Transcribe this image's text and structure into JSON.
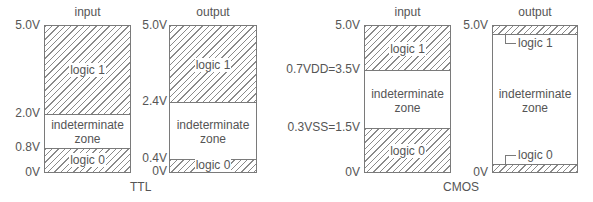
{
  "ttl": {
    "group_label": "TTL",
    "input": {
      "title": "input",
      "ticks": [
        "5.0V",
        "2.0V",
        "0.8V",
        "0V"
      ],
      "zones": {
        "high": "logic 1",
        "mid_line1": "indeterminate",
        "mid_line2": "zone",
        "low": "logic 0"
      }
    },
    "output": {
      "title": "output",
      "ticks": [
        "5.0V",
        "2.4V",
        "0.4V",
        "0V"
      ],
      "zones": {
        "high": "logic 1",
        "mid_line1": "indeterminate",
        "mid_line2": "zone",
        "low": "logic 0"
      }
    }
  },
  "cmos": {
    "group_label": "CMOS",
    "input": {
      "title": "input",
      "ticks": [
        "5.0V",
        "0.7VDD=3.5V",
        "0.3VSS=1.5V",
        "0V"
      ],
      "zones": {
        "high": "logic 1",
        "mid_line1": "indeterminate",
        "mid_line2": "zone",
        "low": "logic 0"
      }
    },
    "output": {
      "title": "output",
      "ticks": [
        "5.0V",
        "0V"
      ],
      "zones": {
        "high": "logic 1",
        "mid_line1": "indeterminate",
        "mid_line2": "zone",
        "low": "logic 0"
      }
    }
  },
  "colors": {
    "line": "#7a7a7a",
    "hatch": "#8a8a8a",
    "text": "#555555"
  }
}
